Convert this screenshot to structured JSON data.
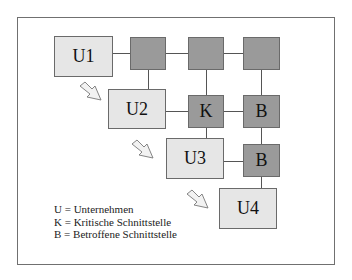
{
  "diagram": {
    "nodes": {
      "u1": "U1",
      "u2": "U2",
      "u3": "U3",
      "u4": "U4",
      "k": "K",
      "b1": "B",
      "b2": "B"
    },
    "legend": [
      "U = Unternehmen",
      "K = Kritische Schnittstelle",
      "B = Betroffene Schnittstelle"
    ],
    "colors": {
      "enterprise_fill": "#e6e6e6",
      "interface_fill": "#9a9a9a",
      "border": "#6a6a6a"
    }
  }
}
